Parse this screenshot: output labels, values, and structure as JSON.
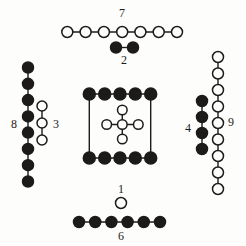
{
  "figure_title": "Hetu dot-number diagram",
  "colors": {
    "paper": "#fdfdfb",
    "ink": "#1d1b19"
  },
  "diagram": {
    "width": 246,
    "height": 246,
    "line_width": 1.4,
    "circle_stroke": 1.5,
    "groups": [
      {
        "id": "seven-top",
        "label": "7",
        "label_x": 122,
        "label_y": 17,
        "fill": "hollow",
        "count": 7,
        "r": 5.5,
        "lines": [
          [
            [
              67.3,
              32
            ],
            [
              177,
              32
            ]
          ]
        ],
        "dots": [
          [
            67.3,
            32
          ],
          [
            85.6,
            32
          ],
          [
            103.9,
            32
          ],
          [
            122.2,
            32
          ],
          [
            140.4,
            32
          ],
          [
            158.7,
            32
          ],
          [
            177,
            32
          ]
        ]
      },
      {
        "id": "two-top",
        "label": "2",
        "label_x": 124,
        "label_y": 64,
        "fill": "filled",
        "count": 2,
        "r": 5.5,
        "lines": [
          [
            [
              116,
              47.5
            ],
            [
              133,
              47.5
            ]
          ]
        ],
        "dots": [
          [
            116,
            47.5
          ],
          [
            133,
            47.5
          ]
        ]
      },
      {
        "id": "eight-left",
        "label": "8",
        "label_x": 14,
        "label_y": 128,
        "fill": "filled",
        "count": 8,
        "r": 5.5,
        "lines": [
          [
            [
              28,
              67.5
            ],
            [
              28,
              181.5
            ]
          ]
        ],
        "dots": [
          [
            28,
            67.5
          ],
          [
            28,
            83.8
          ],
          [
            28,
            100.1
          ],
          [
            28,
            116.4
          ],
          [
            28,
            132.6
          ],
          [
            28,
            148.9
          ],
          [
            28,
            165.2
          ],
          [
            28,
            181.5
          ]
        ]
      },
      {
        "id": "three-left",
        "label": "3",
        "label_x": 56,
        "label_y": 128,
        "fill": "hollow",
        "count": 3,
        "r": 5,
        "lines": [
          [
            [
              42,
              106
            ],
            [
              42,
              140
            ]
          ]
        ],
        "dots": [
          [
            42,
            106
          ],
          [
            42,
            123
          ],
          [
            42,
            140
          ]
        ]
      },
      {
        "id": "four-right",
        "label": "4",
        "label_x": 188,
        "label_y": 132,
        "fill": "filled",
        "count": 4,
        "r": 5.5,
        "lines": [
          [
            [
              202,
              101
            ],
            [
              202,
              149
            ]
          ]
        ],
        "dots": [
          [
            202,
            101
          ],
          [
            202,
            117
          ],
          [
            202,
            133
          ],
          [
            202,
            149
          ]
        ]
      },
      {
        "id": "nine-right",
        "label": "9",
        "label_x": 231,
        "label_y": 126,
        "fill": "hollow",
        "count": 9,
        "r": 5.5,
        "lines": [
          [
            [
              218,
              57
            ],
            [
              218,
              189
            ]
          ]
        ],
        "dots": [
          [
            218,
            57
          ],
          [
            218,
            73.5
          ],
          [
            218,
            90
          ],
          [
            218,
            106.5
          ],
          [
            218,
            123
          ],
          [
            218,
            139.5
          ],
          [
            218,
            156
          ],
          [
            218,
            172.5
          ],
          [
            218,
            189
          ]
        ]
      },
      {
        "id": "ten-center-square",
        "label": "",
        "label_x": 0,
        "label_y": 0,
        "fill": "filled",
        "count": 10,
        "r": 6,
        "lines": [
          [
            [
              89.3,
              94
            ],
            [
              150.7,
              94
            ]
          ],
          [
            [
              89.3,
              158
            ],
            [
              150.7,
              158
            ]
          ],
          [
            [
              89.3,
              94
            ],
            [
              89.3,
              158
            ]
          ],
          [
            [
              150.7,
              94
            ],
            [
              150.7,
              158
            ]
          ]
        ],
        "dots": [
          [
            89.3,
            94
          ],
          [
            104.7,
            94
          ],
          [
            120,
            94
          ],
          [
            135.3,
            94
          ],
          [
            150.7,
            94
          ],
          [
            89.3,
            158
          ],
          [
            104.7,
            158
          ],
          [
            120,
            158
          ],
          [
            135.3,
            158
          ],
          [
            150.7,
            158
          ]
        ]
      },
      {
        "id": "five-center-cross",
        "label": "",
        "label_x": 0,
        "label_y": 0,
        "fill": "hollow",
        "count": 5,
        "r": 4.8,
        "lines": [
          [
            [
              122.3,
              110
            ],
            [
              122.3,
              139
            ]
          ],
          [
            [
              106.7,
              124.5
            ],
            [
              138.3,
              124.5
            ]
          ]
        ],
        "dots": [
          [
            122.3,
            110
          ],
          [
            106.7,
            124.5
          ],
          [
            122.3,
            124.5
          ],
          [
            138.3,
            124.5
          ],
          [
            122.3,
            139
          ]
        ]
      },
      {
        "id": "one-bottom",
        "label": "1",
        "label_x": 121,
        "label_y": 193,
        "fill": "hollow",
        "count": 1,
        "r": 5.5,
        "lines": [],
        "dots": [
          [
            121,
            203
          ]
        ]
      },
      {
        "id": "six-bottom",
        "label": "6",
        "label_x": 121,
        "label_y": 240,
        "fill": "filled",
        "count": 6,
        "r": 5.5,
        "lines": [
          [
            [
              79,
              222
            ],
            [
              160,
              222
            ]
          ]
        ],
        "dots": [
          [
            79,
            222
          ],
          [
            95.2,
            222
          ],
          [
            111.4,
            222
          ],
          [
            127.6,
            222
          ],
          [
            143.8,
            222
          ],
          [
            160,
            222
          ]
        ]
      }
    ]
  }
}
